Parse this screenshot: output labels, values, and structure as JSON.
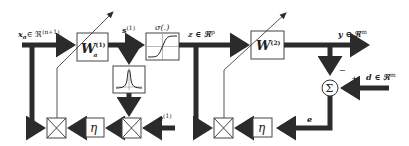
{
  "diagram": {
    "colors": {
      "line": "#2b2b2b",
      "box_fill": "#ffffff",
      "box_stroke": "#444444",
      "background": "#ffffff"
    },
    "labels": {
      "input": "x",
      "input_sub": "a",
      "input_set": "∈ ℜ",
      "input_dim": "(n+1)",
      "s1": "s",
      "s1_sup": "(1)",
      "sigma": "σ(.)",
      "z": "z ∈ ℜ",
      "z_dim": "p",
      "y": "y ∈ ℜ",
      "y_dim": "m",
      "d": "d ∈ ℜ",
      "d_dim": "m",
      "minus": "−",
      "plus": "+",
      "e": "e",
      "e1": "e",
      "e1_sup": "(1)"
    },
    "blocks": {
      "w1": {
        "label": "W",
        "sup": "(1)",
        "sub": "a"
      },
      "w2": {
        "label": "W",
        "sup": "(2)"
      },
      "activation": {
        "name": "sigmoid"
      },
      "derivative": {
        "name": "bell-curve"
      },
      "eta_left": {
        "label": "η"
      },
      "eta_right": {
        "label": "η"
      },
      "sum": {
        "label": "Σ"
      }
    }
  }
}
